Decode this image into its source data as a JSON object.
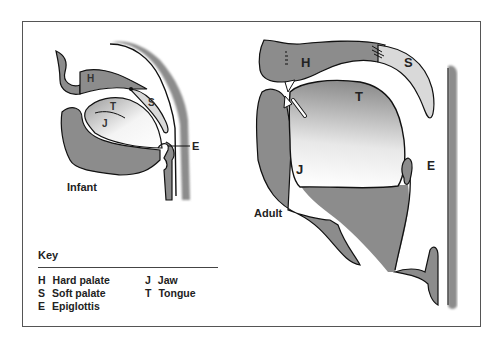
{
  "diagram": {
    "infant": {
      "caption": "Infant",
      "labels": {
        "H": "H",
        "S": "S",
        "T": "T",
        "J": "J",
        "E": "E"
      }
    },
    "adult": {
      "caption": "Adult",
      "labels": {
        "H": "H",
        "S": "S",
        "T": "T",
        "J": "J",
        "E": "E"
      }
    },
    "colors": {
      "tissue": "#8c8c8c",
      "soft_palate": "#d9d9d9",
      "outline": "#111111",
      "frame": "#555555"
    }
  },
  "key": {
    "title": "Key",
    "items": [
      {
        "code": "H",
        "label": "Hard palate"
      },
      {
        "code": "J",
        "label": "Jaw"
      },
      {
        "code": "S",
        "label": "Soft palate"
      },
      {
        "code": "T",
        "label": "Tongue"
      },
      {
        "code": "E",
        "label": "Epiglottis"
      }
    ]
  }
}
